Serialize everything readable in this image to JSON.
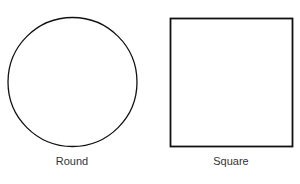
{
  "shapes": [
    {
      "name": "circle",
      "label": "Round"
    },
    {
      "name": "square",
      "label": "Square"
    }
  ],
  "colors": {
    "stroke": "#111111",
    "label": "#333333",
    "background": "#ffffff"
  }
}
